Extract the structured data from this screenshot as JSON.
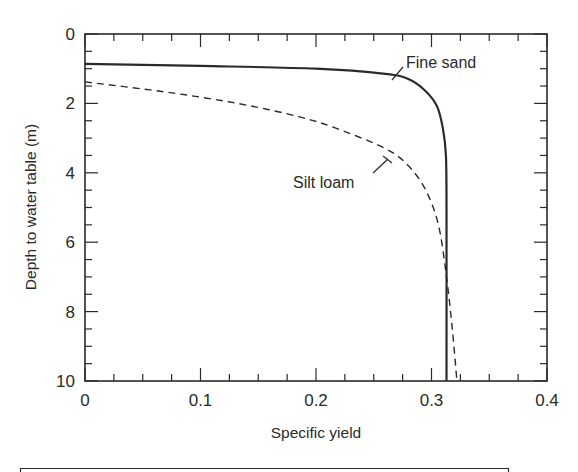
{
  "chart_data": {
    "type": "line",
    "title": "",
    "xlabel": "Specific yield",
    "ylabel": "Depth to water table (m)",
    "xlim": [
      0,
      0.4
    ],
    "ylim": [
      0,
      10
    ],
    "y_inverted": true,
    "grid": false,
    "legend": "none (inline annotations)",
    "x_ticks": [
      0,
      0.1,
      0.2,
      0.3,
      0.4
    ],
    "x_tick_labels": [
      "0",
      "0.1",
      "0.2",
      "0.3",
      "0.4"
    ],
    "y_ticks": [
      0,
      2,
      4,
      6,
      8,
      10
    ],
    "y_tick_labels": [
      "0",
      "2",
      "4",
      "6",
      "8",
      "10"
    ],
    "x_minor_step": 0.025,
    "y_minor_step": 0.5,
    "series": [
      {
        "name": "Fine sand",
        "style": "solid",
        "color": "#2a2a2a",
        "x": [
          0,
          0.1,
          0.2,
          0.26,
          0.28,
          0.295,
          0.305,
          0.31,
          0.3125,
          0.313,
          0.313
        ],
        "y": [
          0.86,
          0.92,
          1.0,
          1.15,
          1.3,
          1.65,
          2.1,
          2.75,
          3.5,
          5.0,
          10.0
        ]
      },
      {
        "name": "Silt loam",
        "style": "dashed",
        "color": "#2a2a2a",
        "x": [
          0,
          0.056,
          0.1,
          0.143,
          0.186,
          0.216,
          0.26,
          0.28,
          0.295,
          0.306,
          0.313,
          0.318,
          0.322
        ],
        "y": [
          1.38,
          1.61,
          1.82,
          2.07,
          2.39,
          2.7,
          3.3,
          3.8,
          4.5,
          5.5,
          7.0,
          8.5,
          10.0
        ]
      }
    ],
    "annotations": [
      {
        "text": "Fine sand",
        "series": "Fine sand",
        "pointer_to": [
          0.265,
          1.3
        ],
        "label_at": [
          0.279,
          0.95
        ]
      },
      {
        "text": "Silt loam",
        "series": "Silt loam",
        "pointer_to": [
          0.261,
          3.6
        ],
        "label_at": [
          0.25,
          4.3
        ]
      }
    ]
  },
  "labels": {
    "xlabel": "Specific yield",
    "ylabel": "Depth to water table (m)",
    "fine_sand": "Fine sand",
    "silt_loam": "Silt loam"
  }
}
